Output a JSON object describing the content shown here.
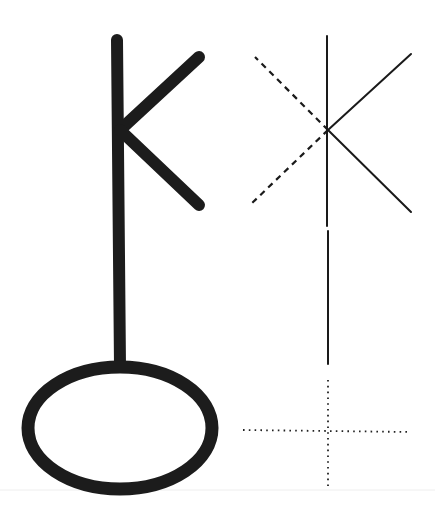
{
  "figure": {
    "kind": "geometric rune construction diagram",
    "background_color": "#ffffff",
    "ink_color": "#1c1c1c",
    "text_labels": []
  },
  "left_glyph": {
    "description": "thick K-shaped rune on a vertical stem ending in an oval loop",
    "stem": {
      "x1": 117,
      "y1": 40,
      "x2": 120,
      "y2": 366
    },
    "upper_arm": {
      "x1": 120,
      "y1": 130,
      "x2": 199,
      "y2": 57
    },
    "lower_arm": {
      "x1": 120,
      "y1": 130,
      "x2": 199,
      "y2": 205
    },
    "oval": {
      "cx": 120,
      "cy": 428,
      "rx": 92,
      "ry": 61
    },
    "stroke_width": 12
  },
  "right_construction": {
    "description": "thin-line construction of the same rune with dashed mirrored arms and dotted crosshair",
    "vertical_upper": {
      "x1": 327,
      "y1": 36,
      "x2": 327,
      "y2": 226
    },
    "vertical_lower": {
      "x1": 328,
      "y1": 231,
      "x2": 328,
      "y2": 364
    },
    "intersection": {
      "x": 328,
      "y": 130
    },
    "solid_arm_up": {
      "x1": 328,
      "y1": 130,
      "x2": 411,
      "y2": 54
    },
    "solid_arm_down": {
      "x1": 328,
      "y1": 130,
      "x2": 411,
      "y2": 212
    },
    "dashed_arm_up": {
      "x1": 328,
      "y1": 130,
      "x2": 255,
      "y2": 57
    },
    "dashed_arm_down": {
      "x1": 328,
      "y1": 130,
      "x2": 249,
      "y2": 206
    },
    "dotted_vertical": {
      "x1": 328,
      "y1": 380,
      "x2": 328,
      "y2": 488
    },
    "dotted_horizontal": {
      "x1": 243,
      "y1": 430,
      "x2": 411,
      "y2": 432
    }
  },
  "baseline": {
    "x1": 0,
    "y1": 490,
    "x2": 435,
    "y2": 490
  }
}
